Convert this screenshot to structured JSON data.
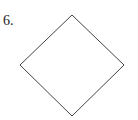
{
  "problem": {
    "number_label": "6."
  },
  "shape": {
    "type": "diamond",
    "vertices": {
      "top": [
        72,
        15
      ],
      "right": [
        124,
        65
      ],
      "bottom": [
        72,
        116
      ],
      "left": [
        20,
        65
      ]
    },
    "stroke_color": "#444444"
  }
}
